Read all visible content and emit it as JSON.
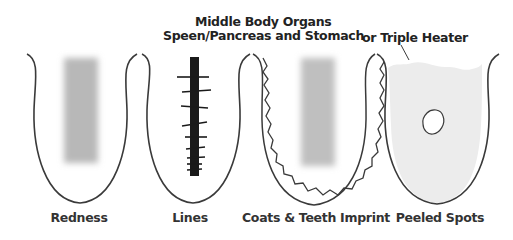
{
  "header": {
    "line1": "Middle Body Organs",
    "line2": "Speen/Pancreas and Stomach",
    "line3": "or Triple Heater"
  },
  "tongues": [
    {
      "label": "Redness",
      "feature": "red-patch"
    },
    {
      "label": "Lines",
      "feature": "central-crack-with-lines"
    },
    {
      "label": "Coats & Teeth Imprint",
      "feature": "scalloped-edge-with-coat"
    },
    {
      "label": "Peeled Spots",
      "feature": "peeled-spot-with-coating"
    }
  ],
  "colors": {
    "outline": "#3a3a3a",
    "patch": "#bdbdbd",
    "crack": "#1a1a1a",
    "coating": "#ececec"
  }
}
